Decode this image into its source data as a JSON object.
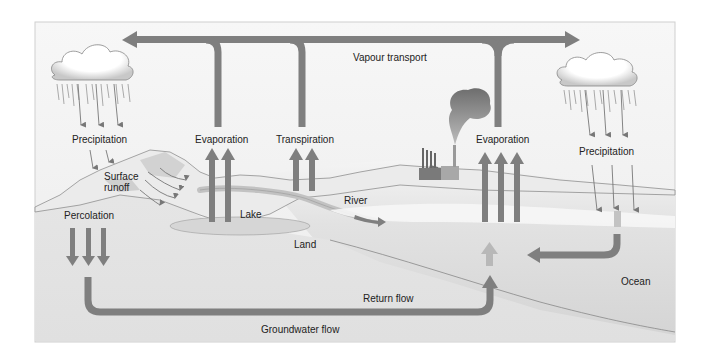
{
  "diagram": {
    "colors": {
      "arrow": "#7f7f7f",
      "arrow_light": "#b8b8b8",
      "sky": "#f2f2f2",
      "land": "#dcdcdc",
      "ocean": "#cfcfcf",
      "text": "#222222"
    },
    "labels": {
      "vapour_transport": "Vapour transport",
      "precipitation_left": "Precipitation",
      "evaporation_left": "Evaporation",
      "transpiration": "Transpiration",
      "evaporation_right": "Evaporation",
      "precipitation_right": "Precipitation",
      "surface_runoff_1": "Surface",
      "surface_runoff_2": "runoff",
      "percolation": "Percolation",
      "lake": "Lake",
      "river": "River",
      "land": "Land",
      "return_flow": "Return flow",
      "ocean": "Ocean",
      "groundwater_flow": "Groundwater flow"
    }
  }
}
